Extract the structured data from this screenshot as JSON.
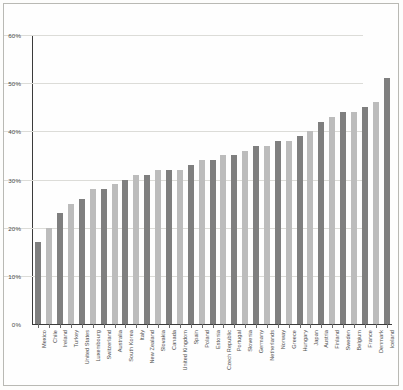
{
  "chart_data": {
    "type": "bar",
    "title": "",
    "subtitle": "",
    "xlabel": "",
    "ylabel": "",
    "ylim": [
      0,
      60
    ],
    "ytick_labels": [
      "0%",
      "10%",
      "20%",
      "30%",
      "40%",
      "50%",
      "60%"
    ],
    "ytick_values": [
      0,
      10,
      20,
      30,
      40,
      50,
      60
    ],
    "grid": true,
    "legend": "none",
    "value_unit": "%",
    "categories": [
      "Mexico",
      "Chile",
      "Ireland",
      "Turkey",
      "United States",
      "Luxembourg",
      "Switzerland",
      "Australia",
      "South Korea",
      "Italy",
      "New Zealand",
      "Slovakia",
      "Canada",
      "United Kingdom",
      "Spain",
      "Poland",
      "Estonia",
      "Czech Republic",
      "Portugal",
      "Slovenia",
      "Germany",
      "Netherlands",
      "Norway",
      "Greece",
      "Hungary",
      "Japan",
      "Austria",
      "Finland",
      "Sweden",
      "Belgium",
      "France",
      "Denmark",
      "Iceland"
    ],
    "values": [
      17,
      20,
      23,
      25,
      26,
      28,
      28,
      29,
      30,
      31,
      31,
      32,
      32,
      32,
      33,
      34,
      34,
      35,
      35,
      36,
      37,
      37,
      38,
      38,
      39,
      40,
      42,
      43,
      44,
      44,
      45,
      46,
      51
    ],
    "colors": {
      "bar_dark": "#7f7f7f",
      "bar_light": "#bcbcbc",
      "gridline": "#dcdcd8",
      "axis": "#3b3b3b",
      "background": "#fefefe",
      "frame": "#b9b9b4"
    }
  }
}
